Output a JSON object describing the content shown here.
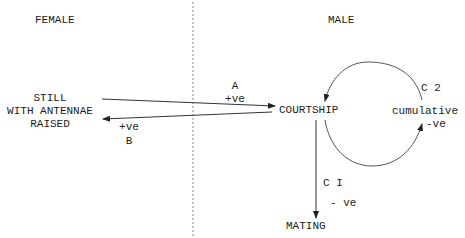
{
  "regions": {
    "female": "FEMALE",
    "male": "MALE"
  },
  "female_state": {
    "line1": "STILL",
    "line2": "WITH ANTENNAE",
    "line3": "RAISED"
  },
  "nodes": {
    "courtship": "COURTSHIP",
    "mating": "MATING"
  },
  "edges": {
    "A": {
      "label": "A",
      "sign": "+ve",
      "from": "female_state",
      "to": "courtship"
    },
    "B": {
      "label": "B",
      "sign": "+ve",
      "from": "courtship",
      "to": "female_state"
    },
    "C1": {
      "label": "C I",
      "sign": "- ve",
      "from": "courtship",
      "to": "mating"
    },
    "C2": {
      "label": "C 2",
      "qualifier": "cumulative",
      "sign": "-ve",
      "from": "courtship",
      "to": "courtship"
    }
  },
  "colors": {
    "line": "#333333",
    "divider": "#888888",
    "text": "#1a1a1a"
  }
}
